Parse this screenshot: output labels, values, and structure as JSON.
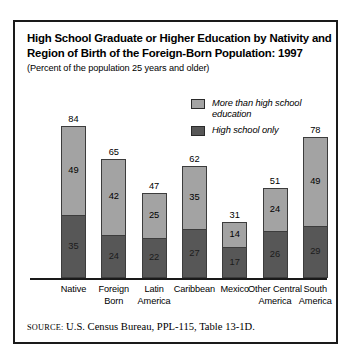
{
  "figure": {
    "title_line1": "High School Graduate or Higher Education by Nativity and",
    "title_line2": "Region of Birth of the Foreign-Born Population: 1997",
    "subtitle": "(Percent of the population 25 years and older)",
    "source_key": "SOURCE:",
    "source_text": "U.S. Census Bureau, PPL-115, Table 13-1D."
  },
  "legend": {
    "items": [
      {
        "label_line1": "More than high school",
        "label_line2": "education",
        "color": "#a3a3a3",
        "name": "more-than-high-school"
      },
      {
        "label_line1": "High school only",
        "label_line2": "",
        "color": "#575757",
        "name": "high-school-only"
      }
    ]
  },
  "chart_data": {
    "type": "bar",
    "stacked": true,
    "title": "High School Graduate or Higher Education by Nativity and Region of Birth of the Foreign-Born Population: 1997",
    "subtitle": "(Percent of the population 25 years and older)",
    "xlabel": "",
    "ylabel": "",
    "ylim": [
      0,
      84
    ],
    "grid": false,
    "legend_position": "top-right",
    "categories": [
      "Native",
      "Foreign Born",
      "Latin America",
      "Caribbean",
      "Mexico",
      "Other Central America",
      "South America"
    ],
    "category_lines": [
      [
        "Native"
      ],
      [
        "Foreign",
        "Born"
      ],
      [
        "Latin",
        "America"
      ],
      [
        "Caribbean"
      ],
      [
        "Mexico"
      ],
      [
        "Other Central",
        "America"
      ],
      [
        "South",
        "America"
      ]
    ],
    "series": [
      {
        "name": "High school only",
        "color": "#575757",
        "values": [
          35,
          24,
          22,
          27,
          17,
          26,
          29
        ]
      },
      {
        "name": "More than high school education",
        "color": "#a3a3a3",
        "values": [
          49,
          42,
          25,
          35,
          14,
          24,
          49
        ]
      }
    ],
    "totals": [
      84,
      65,
      47,
      62,
      31,
      51,
      78
    ]
  }
}
